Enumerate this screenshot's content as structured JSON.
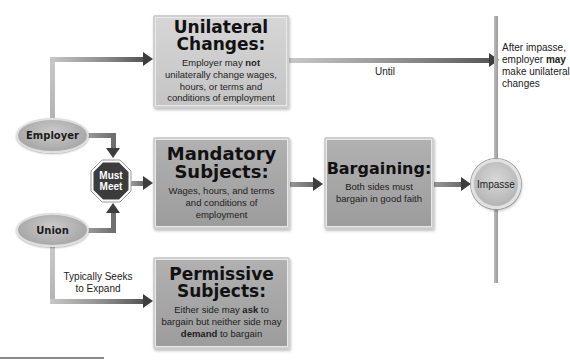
{
  "nodes": {
    "employer": {
      "label": "Employer"
    },
    "union": {
      "label": "Union"
    },
    "must_meet": {
      "line1": "Must",
      "line2": "Meet"
    },
    "impasse": {
      "label": "Impasse"
    }
  },
  "boxes": {
    "unilateral": {
      "title_line1": "Unilateral",
      "title_line2": "Changes:",
      "body_pre": "Employer may ",
      "body_bold": "not",
      "body_post": " unilaterally change wages, hours, or terms and conditions of employment"
    },
    "mandatory": {
      "title_line1": "Mandatory",
      "title_line2": "Subjects:",
      "body": "Wages, hours, and terms and conditions of employment"
    },
    "bargaining": {
      "title": "Bargaining:",
      "body": "Both sides must bargain in good faith"
    },
    "permissive": {
      "title_line1": "Permissive",
      "title_line2": "Subjects:",
      "body_1": "Either side may ",
      "body_bold_1": "ask",
      "body_2": " to bargain but neither side may ",
      "body_bold_2": "demand",
      "body_3": " to bargain"
    }
  },
  "labels": {
    "until": "Until",
    "typically_seeks_line1": "Typically Seeks",
    "typically_seeks_line2": "to Expand",
    "after_impasse_line1": "After impasse,",
    "after_impasse_line2_pre": "employer ",
    "after_impasse_line2_bold": "may",
    "after_impasse_line3": "make unilateral",
    "after_impasse_line4": "changes"
  },
  "colors": {
    "box_light": "#cccccc",
    "box_mid": "#a6a6a6",
    "octagon": "#3c3c3c",
    "arrow": "#3d3d3d",
    "line_light": "#c4c4c4"
  }
}
